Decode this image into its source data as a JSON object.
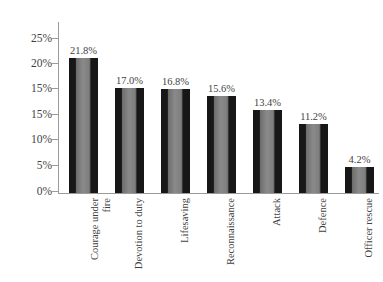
{
  "chart_data": {
    "type": "bar",
    "title": "",
    "subtitle": "",
    "xlabel": "",
    "ylabel": "",
    "categories": [
      "Courage under fire",
      "Devotion to duty",
      "Lifesaving",
      "Reconnaissance",
      "Attack",
      "Defence",
      "Officer rescue"
    ],
    "category_lines": [
      [
        "Courage under",
        "fire"
      ],
      [
        "Devotion to duty"
      ],
      [
        "Lifesaving"
      ],
      [
        "Reconnaissance"
      ],
      [
        "Attack"
      ],
      [
        "Defence"
      ],
      [
        "Officer rescue"
      ]
    ],
    "values": [
      21.8,
      17.0,
      16.8,
      15.6,
      13.4,
      11.2,
      4.2
    ],
    "data_labels": [
      "21.8%",
      "17.0%",
      "16.8%",
      "15.6%",
      "13.4%",
      "11.2%",
      "4.2%"
    ],
    "ytick_labels": [
      "25%",
      "20%",
      "15%",
      "15%",
      "10%",
      "5%",
      "0%"
    ],
    "ytick_values": [
      25,
      20,
      15,
      15,
      10,
      5,
      0
    ],
    "ylim": [
      0,
      25
    ],
    "grid": false,
    "legend": null,
    "bar_color_dark": "#171717",
    "bar_color_light": "#8a8a8a",
    "axis_color": "#9a9a9a",
    "text_color": "#3f3f3f",
    "background_color": "#ffffff"
  }
}
